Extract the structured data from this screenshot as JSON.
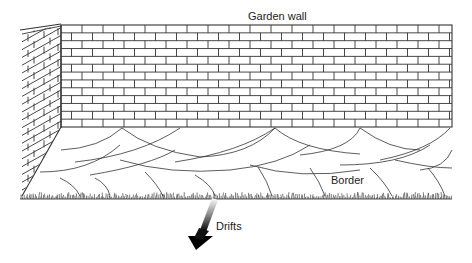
{
  "diagram": {
    "labels": {
      "garden_wall": "Garden wall",
      "border": "Border",
      "drifts": "Drifts"
    },
    "elements": {
      "front_wall": "brick wall (running bond)",
      "side_wall": "brick wall in perspective (left return)",
      "border_pattern": "overlapping scalloped drifts of planting",
      "ground": "grass edge",
      "arrow": "shaded arrow pointing to drifts"
    },
    "colors": {
      "line": "#333333",
      "background": "#ffffff"
    }
  }
}
